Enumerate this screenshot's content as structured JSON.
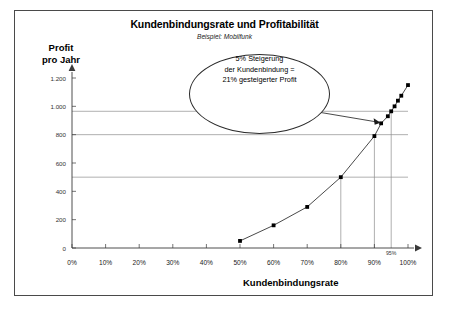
{
  "chart_data": {
    "type": "line",
    "title": "Kundenbindungsrate und Profitabilität",
    "subtitle": "Beispiel: Mobilfunk",
    "xlabel": "Kundenbindungsrate",
    "ylabel_line1": "Profit",
    "ylabel_line2": "pro Jahr",
    "xlim": [
      0,
      100
    ],
    "ylim": [
      0,
      1200
    ],
    "grid": false,
    "legend": "none",
    "x_ticks": [
      "0%",
      "10%",
      "20%",
      "30%",
      "40%",
      "50%",
      "60%",
      "70%",
      "80%",
      "90%",
      "100%"
    ],
    "x_tick_values": [
      0,
      10,
      20,
      30,
      40,
      50,
      60,
      70,
      80,
      90,
      100
    ],
    "y_ticks": [
      "0",
      "200",
      "400",
      "600",
      "800",
      "1.000",
      "1.200"
    ],
    "y_tick_values": [
      0,
      200,
      400,
      600,
      800,
      1000,
      1200
    ],
    "x": [
      50,
      60,
      70,
      80,
      90,
      92,
      94,
      95,
      96,
      97,
      98,
      100
    ],
    "values": [
      50,
      160,
      290,
      500,
      790,
      880,
      930,
      965,
      1000,
      1040,
      1075,
      1150
    ],
    "series": [
      {
        "name": "Profit pro Jahr",
        "x": [
          50,
          60,
          70,
          80,
          90,
          92,
          94,
          95,
          96,
          97,
          98,
          100
        ],
        "values": [
          50,
          160,
          290,
          500,
          790,
          880,
          930,
          965,
          1000,
          1040,
          1075,
          1150
        ]
      }
    ],
    "reference_lines_horizontal": [
      500,
      800,
      965
    ],
    "reference_lines_vertical": [
      80,
      90,
      95
    ],
    "annotations": [
      {
        "text": "95%",
        "x": 95,
        "y": 0
      },
      {
        "text": "5% Steigerung",
        "kind": "callout-line1"
      },
      {
        "text": "der Kundenbindung =",
        "kind": "callout-line2"
      },
      {
        "text": "21% gesteigerter Profit",
        "kind": "callout-line3"
      }
    ]
  },
  "callout": {
    "line1": "5% Steigerung",
    "line2": "der Kundenbindung =",
    "line3": "21% gesteigerter Profit"
  },
  "colors": {
    "frame": "#4a4a4a",
    "axis": "#3a3a3a",
    "curve": "#1a1a1a",
    "marker": "#000000",
    "reference": "#8e8e8e"
  }
}
